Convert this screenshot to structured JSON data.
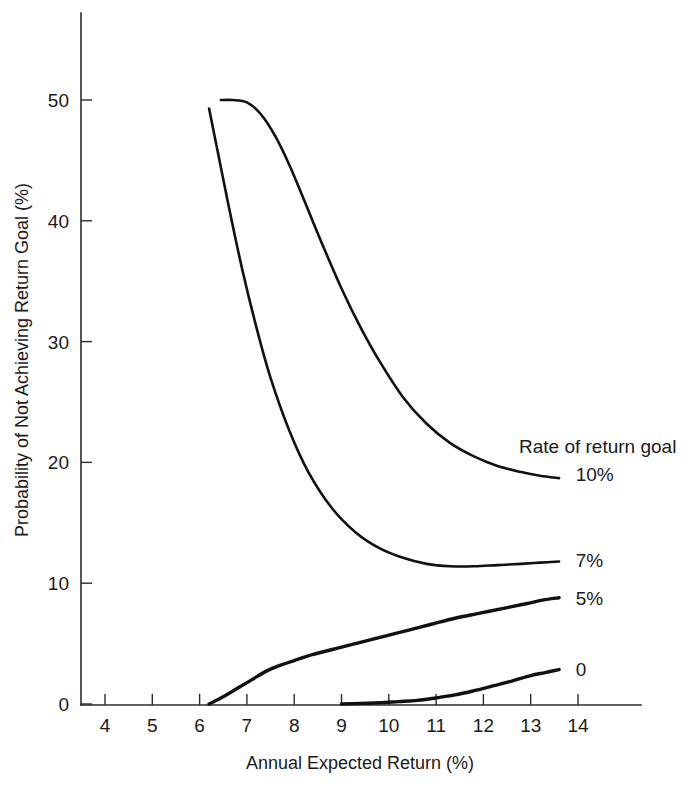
{
  "chart_data": {
    "type": "line",
    "title": "",
    "xlabel": "Annual Expected Return (%)",
    "ylabel": "Probability of Not Achieving Return Goal (%)",
    "xlim": [
      3.5,
      14.8
    ],
    "ylim": [
      0,
      55
    ],
    "xticks": [
      "4",
      "5",
      "6",
      "7",
      "8",
      "9",
      "10",
      "11",
      "12",
      "13",
      "14"
    ],
    "xtick_values": [
      4,
      5,
      6,
      7,
      8,
      9,
      10,
      11,
      12,
      13,
      14
    ],
    "yticks": [
      "0",
      "10",
      "20",
      "30",
      "40",
      "50"
    ],
    "ytick_values": [
      0,
      10,
      20,
      30,
      40,
      50
    ],
    "grid": false,
    "legend_position": "right-inline",
    "legend_title": "Rate of return goal",
    "series": [
      {
        "name": "10%",
        "label": "10%",
        "label_x": 13.95,
        "label_y": 19.0,
        "color": "#111111",
        "x": [
          6.45,
          6.7,
          7.0,
          7.3,
          7.6,
          7.9,
          8.2,
          8.6,
          9.0,
          9.4,
          9.8,
          10.3,
          10.8,
          11.3,
          11.8,
          12.3,
          12.8,
          13.2,
          13.6
        ],
        "y": [
          50.0,
          50.0,
          49.8,
          48.8,
          47.0,
          44.6,
          41.8,
          38.0,
          34.4,
          31.2,
          28.4,
          25.4,
          23.2,
          21.6,
          20.5,
          19.7,
          19.2,
          18.9,
          18.7
        ]
      },
      {
        "name": "7%",
        "label": "7%",
        "label_x": 13.95,
        "label_y": 11.9,
        "color": "#111111",
        "x": [
          6.2,
          6.4,
          6.6,
          6.9,
          7.2,
          7.5,
          7.9,
          8.3,
          8.8,
          9.3,
          9.8,
          10.3,
          10.8,
          11.3,
          11.8,
          12.3,
          12.8,
          13.2,
          13.6
        ],
        "y": [
          49.3,
          45.4,
          41.5,
          36.0,
          31.2,
          27.0,
          22.6,
          19.2,
          16.2,
          14.2,
          12.9,
          12.1,
          11.6,
          11.4,
          11.4,
          11.5,
          11.6,
          11.7,
          11.8
        ]
      },
      {
        "name": "5%",
        "label": "5%",
        "label_x": 13.95,
        "label_y": 8.8,
        "color": "#111111",
        "x": [
          6.2,
          6.5,
          6.8,
          7.1,
          7.4,
          7.7,
          8.0,
          8.4,
          8.9,
          9.4,
          9.9,
          10.4,
          10.9,
          11.4,
          11.9,
          12.4,
          12.9,
          13.25,
          13.6
        ],
        "y": [
          0.0,
          0.6,
          1.3,
          2.0,
          2.7,
          3.2,
          3.6,
          4.1,
          4.6,
          5.1,
          5.6,
          6.1,
          6.6,
          7.1,
          7.5,
          7.9,
          8.3,
          8.6,
          8.8
        ]
      },
      {
        "name": "0",
        "label": "0",
        "label_x": 13.95,
        "label_y": 2.9,
        "color": "#111111",
        "x": [
          9.0,
          9.4,
          9.8,
          10.2,
          10.6,
          11.0,
          11.4,
          11.8,
          12.2,
          12.6,
          13.0,
          13.3,
          13.6
        ],
        "y": [
          0.0,
          0.05,
          0.1,
          0.2,
          0.3,
          0.5,
          0.75,
          1.1,
          1.5,
          1.9,
          2.35,
          2.6,
          2.85
        ]
      }
    ]
  }
}
